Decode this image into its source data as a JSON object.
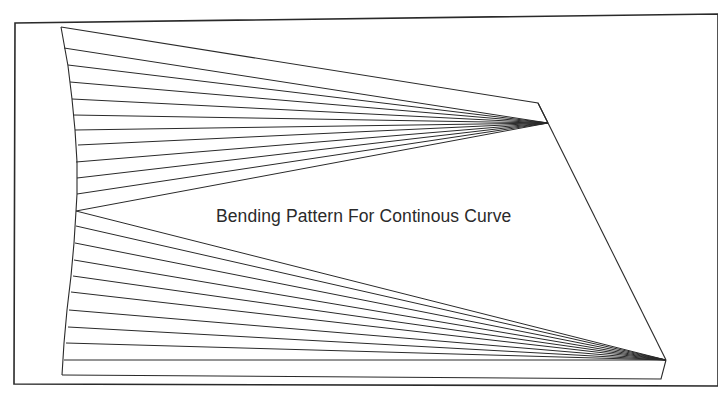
{
  "diagram": {
    "title": "Bending Pattern For Continous Curve",
    "stroke_color": "#2a2a2a",
    "frame": {
      "points": [
        [
          15,
          23
        ],
        [
          718,
          14
        ],
        [
          718,
          386
        ],
        [
          14,
          384
        ]
      ]
    },
    "left_curve": {
      "points": [
        [
          61,
          27
        ],
        [
          68,
          66
        ],
        [
          72,
          99
        ],
        [
          75,
          130
        ],
        [
          77,
          162
        ],
        [
          77,
          194
        ],
        [
          76,
          211
        ],
        [
          74,
          243
        ],
        [
          71,
          276
        ],
        [
          67,
          310
        ],
        [
          64,
          343
        ],
        [
          62,
          375
        ]
      ]
    },
    "top_fan": {
      "focus": [
        548,
        123
      ],
      "top_corner": [
        538,
        103
      ],
      "left_ends": [
        [
          61,
          27
        ],
        [
          64,
          48
        ],
        [
          68,
          65
        ],
        [
          70,
          82
        ],
        [
          72,
          99
        ],
        [
          73,
          115
        ],
        [
          75,
          130
        ],
        [
          78,
          145
        ],
        [
          76,
          162
        ],
        [
          77,
          178
        ],
        [
          77,
          194
        ],
        [
          76,
          211
        ]
      ]
    },
    "bottom_fan": {
      "focus": [
        666,
        360
      ],
      "bottom_corner": [
        661,
        379
      ],
      "left_ends": [
        [
          76,
          211
        ],
        [
          76,
          226
        ],
        [
          75,
          243
        ],
        [
          74,
          260
        ],
        [
          73,
          276
        ],
        [
          71,
          292
        ],
        [
          69,
          310
        ],
        [
          68,
          327
        ],
        [
          66,
          343
        ],
        [
          64,
          360
        ],
        [
          62,
          375
        ]
      ]
    },
    "right_edge": {
      "from": [
        548,
        123
      ],
      "to": [
        666,
        360
      ]
    }
  }
}
